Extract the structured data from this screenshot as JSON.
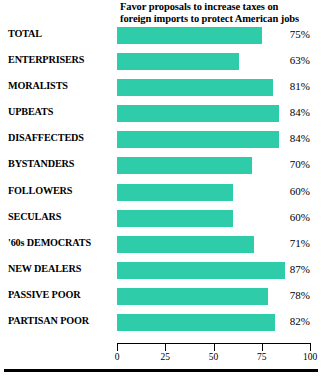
{
  "header": {
    "line1": "Favor proposals to increase taxes on",
    "line2": "foreign imports to protect American jobs"
  },
  "axis": {
    "ticks": [
      "0",
      "25",
      "50",
      "75",
      "100"
    ],
    "tick_values": [
      0,
      25,
      50,
      75,
      100
    ],
    "min": 0,
    "max": 100
  },
  "colors": {
    "bar": "#2ecca8",
    "text": "#000000",
    "background": "#ffffff"
  },
  "rows": [
    {
      "label": "TOTAL",
      "value": 75,
      "value_label": "75%"
    },
    {
      "label": "ENTERPRISERS",
      "value": 63,
      "value_label": "63%"
    },
    {
      "label": "MORALISTS",
      "value": 81,
      "value_label": "81%"
    },
    {
      "label": "UPBEATS",
      "value": 84,
      "value_label": "84%"
    },
    {
      "label": "DISAFFECTEDS",
      "value": 84,
      "value_label": "84%"
    },
    {
      "label": "BYSTANDERS",
      "value": 70,
      "value_label": "70%"
    },
    {
      "label": "FOLLOWERS",
      "value": 60,
      "value_label": "60%"
    },
    {
      "label": "SECULARS",
      "value": 60,
      "value_label": "60%"
    },
    {
      "label": "'60s DEMOCRATS",
      "value": 71,
      "value_label": "71%"
    },
    {
      "label": "NEW DEALERS",
      "value": 87,
      "value_label": "87%"
    },
    {
      "label": "PASSIVE POOR",
      "value": 78,
      "value_label": "78%"
    },
    {
      "label": "PARTISAN POOR",
      "value": 82,
      "value_label": "82%"
    }
  ],
  "chart_data": {
    "type": "bar",
    "orientation": "horizontal",
    "title": "Favor proposals to increase taxes on foreign imports to protect American jobs",
    "xlabel": "",
    "ylabel": "",
    "xlim": [
      0,
      100
    ],
    "grid": false,
    "legend": "none",
    "tick_labels": [
      "0",
      "25",
      "50",
      "75",
      "100"
    ],
    "categories": [
      "TOTAL",
      "ENTERPRISERS",
      "MORALISTS",
      "UPBEATS",
      "DISAFFECTEDS",
      "BYSTANDERS",
      "FOLLOWERS",
      "SECULARS",
      "'60s DEMOCRATS",
      "NEW DEALERS",
      "PASSIVE POOR",
      "PARTISAN POOR"
    ],
    "values": [
      75,
      63,
      81,
      84,
      84,
      70,
      60,
      60,
      71,
      87,
      78,
      82
    ],
    "data_labels": [
      "75%",
      "63%",
      "81%",
      "84%",
      "84%",
      "70%",
      "60%",
      "60%",
      "71%",
      "87%",
      "78%",
      "82%"
    ]
  }
}
